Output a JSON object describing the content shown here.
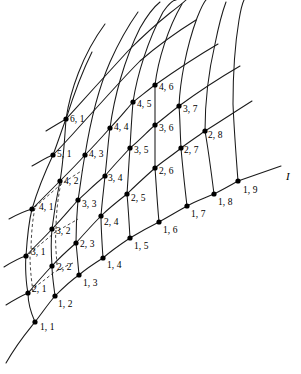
{
  "figure": {
    "kind": "curvilinear-mesh-diagram",
    "background": "#ffffff",
    "stroke": "#1a1a1a",
    "node_fill": "#000000",
    "width": 301,
    "height": 374
  },
  "axis": {
    "label": "I",
    "label_x": 286,
    "label_y": 178,
    "line": {
      "x1": 238,
      "y1": 181,
      "x2": 281,
      "y2": 166
    }
  },
  "nodes": [
    {
      "id": "1,1",
      "label": "1, 1",
      "x": 35,
      "y": 322,
      "lx": 40,
      "ly": 323
    },
    {
      "id": "1,2",
      "label": "1, 2",
      "x": 55,
      "y": 296,
      "lx": 58,
      "ly": 300
    },
    {
      "id": "1,3",
      "label": "1, 3",
      "x": 79,
      "y": 275,
      "lx": 83,
      "ly": 279
    },
    {
      "id": "1,4",
      "label": "1, 4",
      "x": 103,
      "y": 258,
      "lx": 107,
      "ly": 261
    },
    {
      "id": "1,5",
      "label": "1, 5",
      "x": 130,
      "y": 238,
      "lx": 134,
      "ly": 242
    },
    {
      "id": "1,6",
      "label": "1, 6",
      "x": 159,
      "y": 222,
      "lx": 163,
      "ly": 226
    },
    {
      "id": "1,7",
      "label": "1, 7",
      "x": 187,
      "y": 206,
      "lx": 191,
      "ly": 210
    },
    {
      "id": "1,8",
      "label": "1, 8",
      "x": 214,
      "y": 194,
      "lx": 218,
      "ly": 198
    },
    {
      "id": "1,9",
      "label": "1, 9",
      "x": 238,
      "y": 181,
      "lx": 243,
      "ly": 186
    },
    {
      "id": "2,1",
      "label": "2, 1",
      "x": 28,
      "y": 293,
      "lx": 32,
      "ly": 285
    },
    {
      "id": "2,2",
      "label": "2, 2",
      "x": 52,
      "y": 266,
      "lx": 57,
      "ly": 263
    },
    {
      "id": "2,3",
      "label": "2, 3",
      "x": 76,
      "y": 243,
      "lx": 80,
      "ly": 240
    },
    {
      "id": "2,4",
      "label": "2, 4",
      "x": 101,
      "y": 216,
      "lx": 104,
      "ly": 218
    },
    {
      "id": "2,5",
      "label": "2, 5",
      "x": 127,
      "y": 194,
      "lx": 131,
      "ly": 194
    },
    {
      "id": "2,6",
      "label": "2, 6",
      "x": 155,
      "y": 168,
      "lx": 159,
      "ly": 167
    },
    {
      "id": "2,7",
      "label": "2, 7",
      "x": 181,
      "y": 148,
      "lx": 184,
      "ly": 146
    },
    {
      "id": "2,8",
      "label": "2, 8",
      "x": 205,
      "y": 131,
      "lx": 208,
      "ly": 131
    },
    {
      "id": "3,1",
      "label": "3, 1",
      "x": 26,
      "y": 256,
      "lx": 31,
      "ly": 248
    },
    {
      "id": "3,2",
      "label": "3, 2",
      "x": 52,
      "y": 229,
      "lx": 56,
      "ly": 227
    },
    {
      "id": "3,3",
      "label": "3, 3",
      "x": 78,
      "y": 200,
      "lx": 82,
      "ly": 200
    },
    {
      "id": "3,4",
      "label": "3, 4",
      "x": 105,
      "y": 176,
      "lx": 108,
      "ly": 174
    },
    {
      "id": "3,5",
      "label": "3, 5",
      "x": 130,
      "y": 148,
      "lx": 134,
      "ly": 146
    },
    {
      "id": "3,6",
      "label": "3, 6",
      "x": 155,
      "y": 125,
      "lx": 159,
      "ly": 124
    },
    {
      "id": "3,7",
      "label": "3, 7",
      "x": 179,
      "y": 106,
      "lx": 183,
      "ly": 105
    },
    {
      "id": "4,1",
      "label": "4, 1",
      "x": 32,
      "y": 209,
      "lx": 39,
      "ly": 203
    },
    {
      "id": "4,2",
      "label": "4, 2",
      "x": 60,
      "y": 181,
      "lx": 64,
      "ly": 177
    },
    {
      "id": "4,3",
      "label": "4, 3",
      "x": 85,
      "y": 155,
      "lx": 89,
      "ly": 150
    },
    {
      "id": "4,4",
      "label": "4, 4",
      "x": 110,
      "y": 128,
      "lx": 114,
      "ly": 123
    },
    {
      "id": "4,5",
      "label": "4, 5",
      "x": 133,
      "y": 102,
      "lx": 137,
      "ly": 100
    },
    {
      "id": "4,6",
      "label": "4, 6",
      "x": 155,
      "y": 85,
      "lx": 159,
      "ly": 83
    },
    {
      "id": "5,1",
      "label": "5, 1",
      "x": 53,
      "y": 155,
      "lx": 57,
      "ly": 150
    },
    {
      "id": "6,1",
      "label": "6, 1",
      "x": 66,
      "y": 119,
      "lx": 70,
      "ly": 115
    }
  ],
  "label_format": "i, j"
}
